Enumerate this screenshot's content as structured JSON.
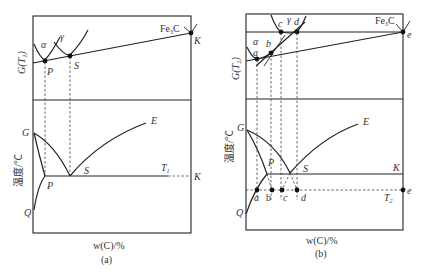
{
  "figure": {
    "panels": [
      {
        "id": "a",
        "caption": "(a)",
        "top_ylabel": "G(T₁)",
        "bottom_ylabel": "温度/℃",
        "xlabel": "w(C)/%",
        "top_labels": {
          "alpha": "α",
          "gamma": "γ",
          "fe3c": "Fe₃C",
          "P": "P",
          "S": "S",
          "K": "K"
        },
        "bottom_labels": {
          "G": "G",
          "E": "E",
          "P": "P",
          "S": "S",
          "T": "T₁",
          "K": "K",
          "Q": "Q"
        }
      },
      {
        "id": "b",
        "caption": "(b)",
        "top_ylabel": "G(T₂)",
        "bottom_ylabel": "温度/℃",
        "xlabel": "w(C)/%",
        "top_labels": {
          "alpha": "α",
          "gamma": "γ",
          "fe3c": "Fe₃C",
          "a": "a",
          "b": "b",
          "c": "c",
          "d": "d",
          "e": "e"
        },
        "bottom_labels": {
          "G": "G",
          "E": "E",
          "P": "P",
          "S": "S",
          "K": "K",
          "T": "T₂",
          "Q": "Q",
          "a": "a",
          "b": "b",
          "c": "c",
          "d": "d",
          "e": "e"
        }
      }
    ]
  }
}
